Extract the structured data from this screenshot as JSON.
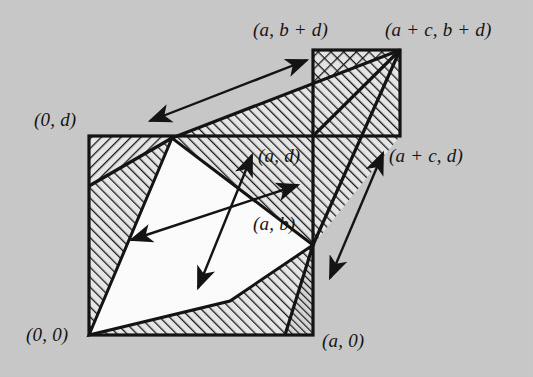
{
  "figure": {
    "background_color": "#c9c9c9",
    "ink_color": "#121212",
    "white_region_color": "#fdfdfd"
  },
  "labels": {
    "origin": "(0, 0)",
    "a_zero": "(a, 0)",
    "zero_d": "(0, d)",
    "a_b_plus_d": "(a, b + d)",
    "a_plus_c_b_plus_d": "(a + c, b + d)",
    "a_plus_c_d": "(a + c, d)",
    "a_d": "(a, d)",
    "a_b": "(a, b)"
  },
  "geometry": {
    "main_square": {
      "x": 89,
      "y": 136,
      "width": 224,
      "height": 199
    },
    "corner_square": {
      "x": 313,
      "y": 50,
      "width": 87,
      "height": 86
    },
    "white_parallelogram_points": "89,335 172,138 313,245 230,301",
    "upper_hatched_triangle": "172,138 400,50 313,136",
    "vertices": {
      "origin": [
        89,
        335
      ],
      "a_zero": [
        313,
        335
      ],
      "zero_d": [
        89,
        136
      ],
      "a_d": [
        313,
        136
      ],
      "a_b_plus_d": [
        313,
        50
      ],
      "a_plus_c_b_plus_d": [
        400,
        50
      ],
      "a_plus_c_d": [
        400,
        136
      ],
      "white_top": [
        172,
        138
      ],
      "white_right": [
        313,
        245
      ]
    }
  },
  "arrows": [
    {
      "name": "vector-c-d-upper",
      "from": [
        150,
        121
      ],
      "to": [
        307,
        60
      ],
      "double_headed": true
    },
    {
      "name": "vector-a-b-center",
      "from": [
        131,
        240
      ],
      "to": [
        298,
        185
      ],
      "double_headed": true
    },
    {
      "name": "vector-c-d-center",
      "from": [
        198,
        288
      ],
      "to": [
        252,
        155
      ],
      "double_headed": true
    },
    {
      "name": "vector-c-d-right",
      "from": [
        330,
        278
      ],
      "to": [
        383,
        153
      ],
      "double_headed": true
    }
  ]
}
